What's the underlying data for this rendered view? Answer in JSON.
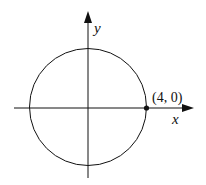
{
  "diagram": {
    "axes": {
      "x_label": "x",
      "y_label": "y"
    },
    "circle": {
      "center": [
        0,
        0
      ],
      "radius": 4
    },
    "point": {
      "label": "(4, 0)",
      "coords": [
        4,
        0
      ]
    },
    "colors": {
      "stroke": "#111111",
      "background": "#ffffff"
    }
  }
}
